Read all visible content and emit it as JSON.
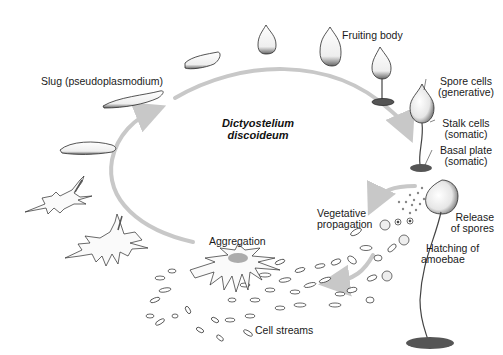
{
  "diagram": {
    "title_line1": "Dictyostelium",
    "title_line2": "discoideum",
    "labels": {
      "slug": "Slug (pseudoplasmodium)",
      "fruiting_body": "Fruiting body",
      "spore_cells_1": "Spore cells",
      "spore_cells_2": "(generative)",
      "stalk_cells_1": "Stalk cells",
      "stalk_cells_2": "(somatic)",
      "basal_plate_1": "Basal plate",
      "basal_plate_2": "(somatic)",
      "vegetative_1": "Vegetative",
      "vegetative_2": "propagation",
      "release_1": "Release",
      "release_2": "of spores",
      "hatching_1": "Hatching of",
      "hatching_2": "amoebae",
      "aggregation": "Aggregation",
      "cell_streams": "Cell streams"
    },
    "stages": [
      "Aggregation",
      "Mound",
      "Slug (pseudoplasmodium)",
      "Culmination",
      "Fruiting body",
      "Release of spores",
      "Hatching of amoebae",
      "Vegetative propagation",
      "Cell streams"
    ],
    "colors": {
      "arrow": "#c8c8c8",
      "ink": "#2a2a2a",
      "shade": "#555555",
      "background": "#ffffff"
    }
  }
}
